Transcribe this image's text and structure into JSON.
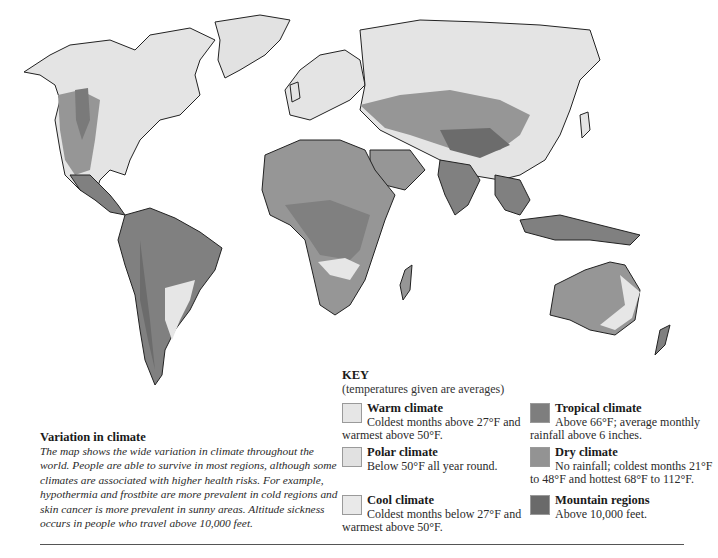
{
  "caption": {
    "title": "Variation in climate",
    "body": "The map shows the wide variation in climate throughout the world. People are able to survive in most regions, although some climates are associated with higher health risks. For example, hypothermia and frostbite are more prevalent in cold regions and skin cancer is more prevalent in sunny areas. Altitude sickness occurs in people who travel above 10,000 feet."
  },
  "key": {
    "title": "KEY",
    "subtitle": "(temperatures given are averages)",
    "items": [
      {
        "name": "Warm climate",
        "desc": "Coldest months above 27°F and warmest above 50°F.",
        "color": "#e6e6e6"
      },
      {
        "name": "Polar climate",
        "desc": "Below 50°F all year round.",
        "color": "#e1e1e1"
      },
      {
        "name": "Cool climate",
        "desc": "Coldest months below 27°F and warmest above 50°F.",
        "color": "#e9e9e9"
      },
      {
        "name": "Tropical climate",
        "desc": "Above 66°F; average monthly rainfall above 6 inches.",
        "color": "#7e7e7e"
      },
      {
        "name": "Dry climate",
        "desc": "No rainfall; coldest months 21°F to 48°F and hottest 68°F to 112°F.",
        "color": "#939393"
      },
      {
        "name": "Mountain regions",
        "desc": "Above 10,000 feet.",
        "color": "#6a6a6a"
      }
    ]
  },
  "map": {
    "colors": {
      "ocean": "#ffffff",
      "outline": "#222222",
      "light": "#e4e4e4",
      "dry": "#969696",
      "tropical": "#808080",
      "mountain": "#6c6c6c"
    }
  }
}
